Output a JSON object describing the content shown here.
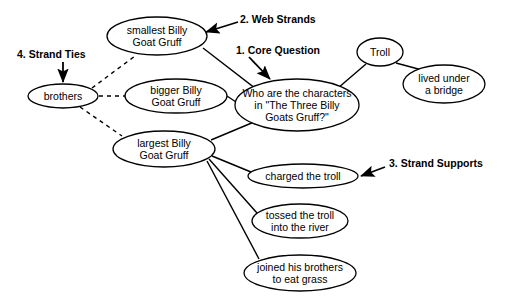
{
  "diagram": {
    "background_color": "#ffffff",
    "stroke_color": "#000000",
    "nodes": [
      {
        "id": "smallest",
        "label": "smallest Billy\nGoat Gruff",
        "cx": 157,
        "cy": 36,
        "rx": 50,
        "ry": 19
      },
      {
        "id": "bigger",
        "label": "bigger Billy\nGoat Gruff",
        "cx": 176,
        "cy": 96,
        "rx": 51,
        "ry": 17
      },
      {
        "id": "largest",
        "label": "largest Billy\nGoat Gruff",
        "cx": 164,
        "cy": 149,
        "rx": 51,
        "ry": 18
      },
      {
        "id": "brothers",
        "label": "brothers",
        "cx": 63,
        "cy": 96,
        "rx": 35,
        "ry": 12
      },
      {
        "id": "core",
        "label": "Who are the characters\nin \"The Three Billy\nGoats Gruff?\"",
        "cx": 297,
        "cy": 105,
        "rx": 62,
        "ry": 26
      },
      {
        "id": "troll",
        "label": "Troll",
        "cx": 380,
        "cy": 52,
        "rx": 23,
        "ry": 14
      },
      {
        "id": "bridge",
        "label": "lived under\na bridge",
        "cx": 444,
        "cy": 84,
        "rx": 41,
        "ry": 19
      },
      {
        "id": "charged",
        "label": "charged the troll",
        "cx": 303,
        "cy": 176,
        "rx": 55,
        "ry": 12
      },
      {
        "id": "tossed",
        "label": "tossed the troll\ninto the river",
        "cx": 300,
        "cy": 221,
        "rx": 48,
        "ry": 17
      },
      {
        "id": "joined",
        "label": "joined his brothers\nto eat grass",
        "cx": 300,
        "cy": 273,
        "rx": 56,
        "ry": 18
      }
    ],
    "solid_edges": [
      {
        "from": "smallest",
        "to": "core",
        "x1": 203,
        "y1": 48,
        "x2": 256,
        "y2": 89
      },
      {
        "from": "bigger",
        "to": "core",
        "x1": 227,
        "y1": 96,
        "x2": 236,
        "y2": 102
      },
      {
        "from": "largest",
        "to": "core",
        "x1": 211,
        "y1": 140,
        "x2": 254,
        "y2": 122
      },
      {
        "from": "core",
        "to": "troll",
        "x1": 338,
        "y1": 88,
        "x2": 366,
        "y2": 64
      },
      {
        "from": "troll",
        "to": "bridge",
        "x1": 396,
        "y1": 63,
        "x2": 422,
        "y2": 70
      },
      {
        "from": "largest",
        "to": "charged",
        "x1": 212,
        "y1": 156,
        "x2": 251,
        "y2": 172
      },
      {
        "from": "largest",
        "to": "tossed",
        "x1": 209,
        "y1": 159,
        "x2": 257,
        "y2": 213
      },
      {
        "from": "largest",
        "to": "joined",
        "x1": 207,
        "y1": 161,
        "x2": 259,
        "y2": 259
      }
    ],
    "dashed_edges": [
      {
        "from": "brothers",
        "to": "smallest",
        "x1": 92,
        "y1": 88,
        "x2": 135,
        "y2": 56
      },
      {
        "from": "brothers",
        "to": "bigger",
        "x1": 99,
        "y1": 96,
        "x2": 125,
        "y2": 96
      },
      {
        "from": "brothers",
        "to": "largest",
        "x1": 80,
        "y1": 107,
        "x2": 122,
        "y2": 136
      }
    ],
    "annotations": [
      {
        "id": "core-question",
        "label": "1. Core Question",
        "label_x": 236,
        "label_y": 44,
        "arrow": {
          "x1": 249,
          "y1": 57,
          "x2": 270,
          "y2": 79
        }
      },
      {
        "id": "web-strands",
        "label": "2. Web Strands",
        "label_x": 240,
        "label_y": 13,
        "arrow": {
          "x1": 238,
          "y1": 22,
          "x2": 206,
          "y2": 32
        }
      },
      {
        "id": "strand-supports",
        "label": "3. Strand Supports",
        "label_x": 389,
        "label_y": 157,
        "arrow": {
          "x1": 385,
          "y1": 167,
          "x2": 361,
          "y2": 176
        }
      },
      {
        "id": "strand-ties",
        "label": "4. Strand Ties",
        "label_x": 17,
        "label_y": 48,
        "arrow": {
          "x1": 63,
          "y1": 62,
          "x2": 63,
          "y2": 82
        }
      }
    ]
  }
}
